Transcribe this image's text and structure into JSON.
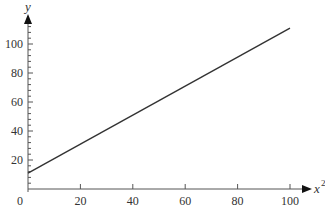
{
  "chart_data": {
    "type": "line",
    "title": "",
    "xlabel": "x",
    "xlabel_superscript": "2",
    "ylabel": "y",
    "xlim": [
      0,
      100
    ],
    "ylim": [
      0,
      115
    ],
    "x_ticks": [
      0,
      20,
      40,
      60,
      80,
      100
    ],
    "y_ticks": [
      20,
      40,
      60,
      80,
      100
    ],
    "x_tick_labels": [
      "0",
      "20",
      "40",
      "60",
      "80",
      "100"
    ],
    "y_tick_labels": [
      "20",
      "40",
      "60",
      "80",
      "100"
    ],
    "grid": false,
    "legend": null,
    "series": [
      {
        "name": "y vs x^2",
        "x": [
          0,
          100
        ],
        "values": [
          11,
          111
        ]
      }
    ]
  },
  "colors": {
    "line": "#333333",
    "axis": "#555555"
  }
}
